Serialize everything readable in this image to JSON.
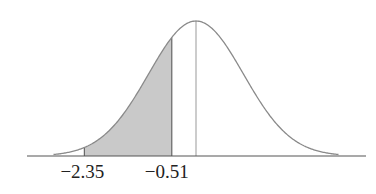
{
  "chart_data": {
    "type": "area",
    "title": "",
    "xlabel": "",
    "ylabel": "",
    "grid": false,
    "legend": null,
    "shaded_region": {
      "from": -2.35,
      "to": -0.51
    },
    "mean_line": 0,
    "tick_labels": [
      "−2.35",
      "−0.51"
    ],
    "x_range": [
      -3,
      3
    ],
    "colors": {
      "curve": "#8a8a8a",
      "shade": "#c9c9c9",
      "axis": "#555555"
    }
  }
}
